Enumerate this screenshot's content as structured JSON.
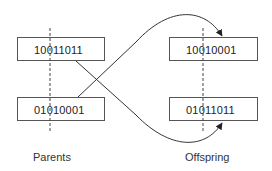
{
  "diagram": {
    "title": "",
    "parents": {
      "label": "Parents",
      "chromosomes": [
        "10011011",
        "01010001"
      ]
    },
    "offspring": {
      "label": "Offspring",
      "chromosomes": [
        "10010001",
        "01011011"
      ]
    },
    "crossover_point": "after bit 3",
    "colors": {
      "line": "#333333",
      "box_border": "#555555"
    }
  }
}
